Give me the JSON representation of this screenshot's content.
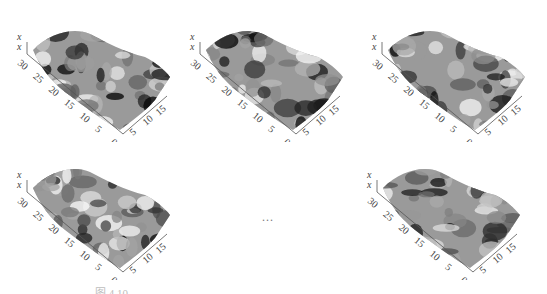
{
  "figure": {
    "panels": [
      {
        "id": "p1",
        "axis_labels": [
          "x",
          "x"
        ],
        "long_axis_ticks": [
          "30",
          "25",
          "20",
          "15",
          "10",
          "5",
          "0"
        ],
        "short_axis_ticks": [
          "5",
          "10",
          "15"
        ]
      },
      {
        "id": "p2",
        "axis_labels": [
          "x",
          "x"
        ],
        "long_axis_ticks": [
          "30",
          "25",
          "20",
          "15",
          "10",
          "5",
          "0"
        ],
        "short_axis_ticks": [
          "5",
          "10",
          "15"
        ]
      },
      {
        "id": "p3",
        "axis_labels": [
          "x",
          "x"
        ],
        "long_axis_ticks": [
          "30",
          "25",
          "20",
          "15",
          "10",
          "5",
          "0"
        ],
        "short_axis_ticks": [
          "5",
          "10",
          "15"
        ]
      },
      {
        "id": "p4",
        "axis_labels": [
          "x",
          "x"
        ],
        "long_axis_ticks": [
          "30",
          "25",
          "20",
          "15",
          "10",
          "5",
          "0"
        ],
        "short_axis_ticks": [
          "5",
          "10",
          "15"
        ]
      },
      {
        "id": "p5",
        "axis_labels": [
          "x",
          "x"
        ],
        "long_axis_ticks": [
          "30",
          "25",
          "20",
          "15",
          "10",
          "5",
          "0"
        ],
        "short_axis_ticks": [
          "5",
          "10",
          "15"
        ]
      }
    ],
    "ellipsis": "...",
    "caption": "图 4.10 …"
  }
}
